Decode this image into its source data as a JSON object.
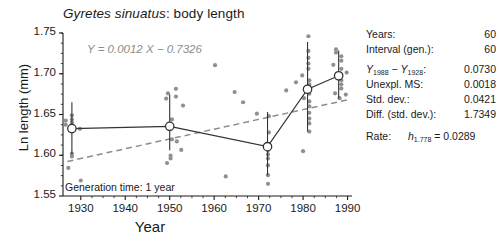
{
  "chart_data": {
    "type": "scatter",
    "title": "Gyretes sinuatus: body length",
    "title_species": "Gyretes sinuatus",
    "title_rest": ": body length",
    "xlabel": "Year",
    "ylabel": "Ln length (mm)",
    "xlim": [
      1926,
      1991
    ],
    "ylim": [
      1.55,
      1.75
    ],
    "xticks": [
      1930,
      1940,
      1950,
      1960,
      1970,
      1980,
      1990
    ],
    "xtick_labels": [
      "1930",
      "1940",
      "1950",
      "1960",
      "1970",
      "1980",
      "1990"
    ],
    "yticks": [
      1.55,
      1.6,
      1.65,
      1.7,
      1.75
    ],
    "ytick_labels": [
      "1.55",
      "1.60",
      "1.65",
      "1.70",
      "1.75"
    ],
    "grid": false,
    "legend": null,
    "annotations": [
      {
        "name": "regression-equation",
        "text": "Y = 0.0012 X − 0.7326",
        "color": "#8d8d8d"
      },
      {
        "name": "generation-time",
        "text": "Generation time: 1 year"
      }
    ],
    "regression_line": {
      "slope": 0.0012,
      "intercept": -0.7326,
      "style": "dashed",
      "color": "#8d8d8d",
      "x_start": 1927,
      "x_end": 1990,
      "y_start": 1.5924,
      "y_end": 1.668
    },
    "series": [
      {
        "name": "sample-means",
        "marker": "open-circle",
        "connected": true,
        "color": "#333333",
        "points": [
          {
            "x": 1928,
            "y": 1.6327,
            "sd_low": 1.601,
            "sd_high": 1.665
          },
          {
            "x": 1950,
            "y": 1.6355,
            "sd_low": 1.606,
            "sd_high": 1.6745
          },
          {
            "x": 1972,
            "y": 1.6105,
            "sd_low": 1.5755,
            "sd_high": 1.653
          },
          {
            "x": 1981,
            "y": 1.681,
            "sd_low": 1.629,
            "sd_high": 1.739
          },
          {
            "x": 1988,
            "y": 1.6975,
            "sd_low": 1.67,
            "sd_high": 1.7285
          }
        ]
      },
      {
        "name": "individual-specimens",
        "marker": "filled-circle",
        "color": "#909090",
        "points": [
          {
            "x": 1928,
            "y": 1.649
          },
          {
            "x": 1928,
            "y": 1.644
          },
          {
            "x": 1928,
            "y": 1.64
          },
          {
            "x": 1928,
            "y": 1.6355
          },
          {
            "x": 1928,
            "y": 1.632
          },
          {
            "x": 1926.6,
            "y": 1.6425
          },
          {
            "x": 1926.6,
            "y": 1.6375
          },
          {
            "x": 1929.8,
            "y": 1.6325
          },
          {
            "x": 1928,
            "y": 1.602
          },
          {
            "x": 1928,
            "y": 1.5985
          },
          {
            "x": 1927.2,
            "y": 1.5845
          },
          {
            "x": 1930,
            "y": 1.569
          },
          {
            "x": 1949.2,
            "y": 1.6695
          },
          {
            "x": 1951.4,
            "y": 1.6815
          },
          {
            "x": 1951.4,
            "y": 1.672
          },
          {
            "x": 1949.6,
            "y": 1.676
          },
          {
            "x": 1953,
            "y": 1.661
          },
          {
            "x": 1950.5,
            "y": 1.644
          },
          {
            "x": 1950.5,
            "y": 1.6195
          },
          {
            "x": 1951.6,
            "y": 1.617
          },
          {
            "x": 1950.2,
            "y": 1.5995
          },
          {
            "x": 1950.2,
            "y": 1.596
          },
          {
            "x": 1949.4,
            "y": 1.5905
          },
          {
            "x": 1952.6,
            "y": 1.6065
          },
          {
            "x": 1960.2,
            "y": 1.7105
          },
          {
            "x": 1962.6,
            "y": 1.574
          },
          {
            "x": 1964.6,
            "y": 1.6775
          },
          {
            "x": 1966.5,
            "y": 1.665
          },
          {
            "x": 1972.3,
            "y": 1.648
          },
          {
            "x": 1972.3,
            "y": 1.628
          },
          {
            "x": 1969.6,
            "y": 1.651
          },
          {
            "x": 1972.1,
            "y": 1.613
          },
          {
            "x": 1972.1,
            "y": 1.606
          },
          {
            "x": 1972.1,
            "y": 1.601
          },
          {
            "x": 1972.1,
            "y": 1.596
          },
          {
            "x": 1972.1,
            "y": 1.5875
          },
          {
            "x": 1972.1,
            "y": 1.5755
          },
          {
            "x": 1972.1,
            "y": 1.565
          },
          {
            "x": 1976.2,
            "y": 1.6795
          },
          {
            "x": 1978.4,
            "y": 1.6895
          },
          {
            "x": 1981.2,
            "y": 1.746
          },
          {
            "x": 1981.2,
            "y": 1.728
          },
          {
            "x": 1981.2,
            "y": 1.7195
          },
          {
            "x": 1981.2,
            "y": 1.7125
          },
          {
            "x": 1981.2,
            "y": 1.706
          },
          {
            "x": 1979.8,
            "y": 1.698
          },
          {
            "x": 1981.4,
            "y": 1.692
          },
          {
            "x": 1981.4,
            "y": 1.687
          },
          {
            "x": 1981.4,
            "y": 1.683
          },
          {
            "x": 1981.4,
            "y": 1.6795
          },
          {
            "x": 1981.4,
            "y": 1.6755
          },
          {
            "x": 1980.2,
            "y": 1.67
          },
          {
            "x": 1981.4,
            "y": 1.666
          },
          {
            "x": 1981.4,
            "y": 1.66
          },
          {
            "x": 1981.4,
            "y": 1.652
          },
          {
            "x": 1981.4,
            "y": 1.645
          },
          {
            "x": 1981.4,
            "y": 1.639
          },
          {
            "x": 1981.4,
            "y": 1.629
          },
          {
            "x": 1980,
            "y": 1.605
          },
          {
            "x": 1987.4,
            "y": 1.73
          },
          {
            "x": 1987.4,
            "y": 1.726
          },
          {
            "x": 1988.6,
            "y": 1.7215
          },
          {
            "x": 1988.6,
            "y": 1.716
          },
          {
            "x": 1986.8,
            "y": 1.711
          },
          {
            "x": 1988.6,
            "y": 1.706
          },
          {
            "x": 1989.8,
            "y": 1.7015
          },
          {
            "x": 1988.6,
            "y": 1.692
          },
          {
            "x": 1988.6,
            "y": 1.687
          },
          {
            "x": 1988.6,
            "y": 1.682
          },
          {
            "x": 1987.2,
            "y": 1.676
          },
          {
            "x": 1989.6,
            "y": 1.6745
          },
          {
            "x": 1988.2,
            "y": 1.67
          }
        ]
      }
    ]
  },
  "stats": {
    "rows": [
      {
        "name": "years",
        "label": "Years:",
        "value": "60"
      },
      {
        "name": "interval-generations",
        "label": "Interval (gen.):",
        "value": "60"
      },
      {
        "name": "y-difference",
        "label_html": "Y_1988 - Y_1928 :",
        "label_var": "Y",
        "sub1": "1988",
        "sub2": "1928",
        "value": "0.0730"
      },
      {
        "name": "unexplained-ms",
        "label": "Unexpl. MS:",
        "value": "0.0018"
      },
      {
        "name": "standard-deviation",
        "label": "Std. dev.:",
        "value": "0.0421"
      },
      {
        "name": "difference-std-dev",
        "label": "Diff. (std. dev.):",
        "value": "1.7349"
      },
      {
        "name": "rate",
        "label": "Rate:",
        "var": "h",
        "sub": "1.778",
        "eq": "=",
        "value": "0.0289"
      }
    ]
  },
  "colors": {
    "axis": "#1a1a1a",
    "specimen_dot": "#909090",
    "mean_marker": "#333333",
    "regression": "#8d8d8d",
    "text": "#1a1a1a"
  }
}
